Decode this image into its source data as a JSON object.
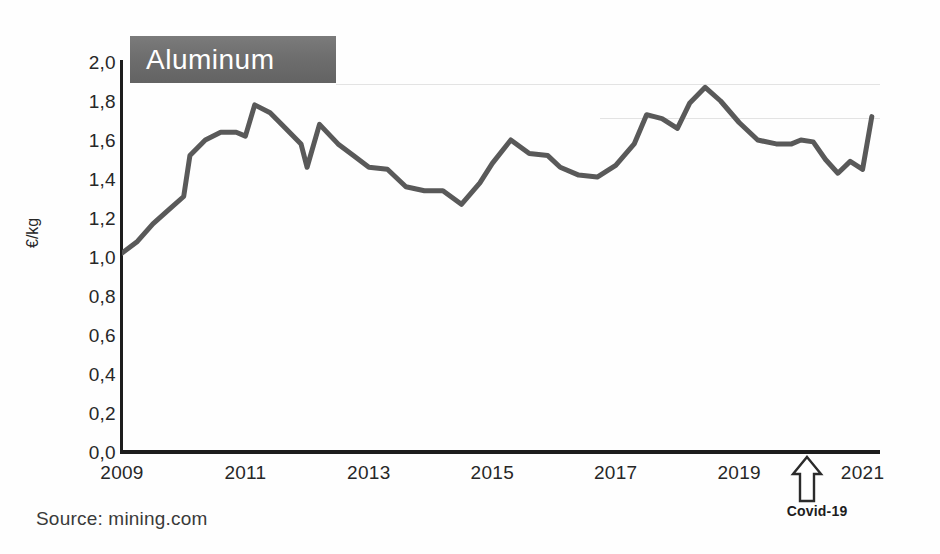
{
  "title": {
    "text": "Aluminum"
  },
  "source": {
    "text": "Source: mining.com"
  },
  "annotation": {
    "covid_label": "Covid-19",
    "covid_icon": "arrow-up-icon"
  },
  "axes": {
    "y_title": "€/kg",
    "y_ticks": [
      "2,0",
      "1,8",
      "1,6",
      "1,4",
      "1,2",
      "1,0",
      "0,8",
      "0,6",
      "0,4",
      "0,2",
      "0,0"
    ],
    "x_ticks": [
      "2009",
      "2011",
      "2013",
      "2015",
      "2017",
      "2019",
      "2021"
    ]
  },
  "colors": {
    "line": "#595959",
    "banner": "#6b6b6b",
    "banner_text": "#ffffff",
    "axis": "#1d1d1d",
    "text": "#272727"
  },
  "chart_data": {
    "type": "line",
    "title": "Aluminum",
    "xlabel": "",
    "ylabel": "€/kg",
    "xlim": [
      2009,
      2021.25
    ],
    "ylim": [
      0.0,
      2.0
    ],
    "yticks": [
      0.0,
      0.2,
      0.4,
      0.6,
      0.8,
      1.0,
      1.2,
      1.4,
      1.6,
      1.8,
      2.0
    ],
    "xticks": [
      2009,
      2011,
      2013,
      2015,
      2017,
      2019,
      2021
    ],
    "grid": false,
    "legend": "none",
    "source": "mining.com",
    "annotations": [
      {
        "label": "Covid-19",
        "x": 2020.1,
        "type": "arrow-up"
      }
    ],
    "series": [
      {
        "name": "Aluminum price",
        "unit": "€/kg",
        "x": [
          2009.0,
          2009.25,
          2009.5,
          2009.75,
          2010.0,
          2010.1,
          2010.35,
          2010.6,
          2010.85,
          2011.0,
          2011.15,
          2011.4,
          2011.65,
          2011.9,
          2012.0,
          2012.2,
          2012.5,
          2012.75,
          2013.0,
          2013.3,
          2013.6,
          2013.9,
          2014.0,
          2014.2,
          2014.5,
          2014.8,
          2015.0,
          2015.3,
          2015.6,
          2015.9,
          2016.1,
          2016.4,
          2016.7,
          2017.0,
          2017.3,
          2017.5,
          2017.75,
          2018.0,
          2018.2,
          2018.45,
          2018.7,
          2019.0,
          2019.3,
          2019.6,
          2019.85,
          2020.0,
          2020.2,
          2020.4,
          2020.6,
          2020.8,
          2021.0,
          2021.15
        ],
        "y": [
          1.02,
          1.08,
          1.17,
          1.24,
          1.31,
          1.52,
          1.6,
          1.64,
          1.64,
          1.62,
          1.78,
          1.74,
          1.66,
          1.58,
          1.46,
          1.68,
          1.58,
          1.52,
          1.46,
          1.45,
          1.36,
          1.34,
          1.34,
          1.34,
          1.27,
          1.38,
          1.48,
          1.6,
          1.53,
          1.52,
          1.46,
          1.42,
          1.41,
          1.47,
          1.58,
          1.73,
          1.71,
          1.66,
          1.79,
          1.87,
          1.8,
          1.69,
          1.6,
          1.58,
          1.58,
          1.6,
          1.59,
          1.5,
          1.43,
          1.49,
          1.45,
          1.72
        ]
      }
    ]
  }
}
